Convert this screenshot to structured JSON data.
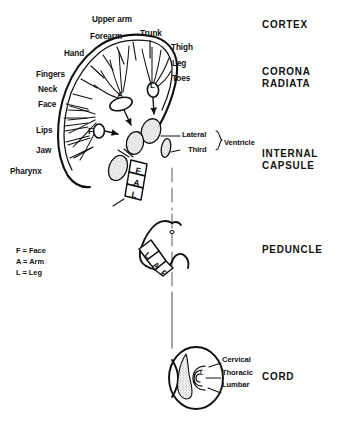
{
  "figure": {
    "ink_color": "#111111",
    "stipple_color": "#9a9a9a",
    "background": "#ffffff"
  },
  "levels": [
    {
      "id": "cortex",
      "line1": "CORTEX",
      "line2": ""
    },
    {
      "id": "corona-radiata",
      "line1": "CORONA",
      "line2": "RADIATA"
    },
    {
      "id": "internal-capsule",
      "line1": "INTERNAL",
      "line2": "CAPSULE"
    },
    {
      "id": "peduncle",
      "line1": "PEDUNCLE",
      "line2": ""
    },
    {
      "id": "cord",
      "line1": "CORD",
      "line2": ""
    }
  ],
  "cortex_labels": [
    {
      "id": "upper-arm",
      "text": "Upper arm"
    },
    {
      "id": "forearm",
      "text": "Forearm"
    },
    {
      "id": "trunk",
      "text": "Trunk"
    },
    {
      "id": "hand",
      "text": "Hand"
    },
    {
      "id": "thigh",
      "text": "Thigh"
    },
    {
      "id": "leg",
      "text": "Leg"
    },
    {
      "id": "toes",
      "text": "Toes"
    },
    {
      "id": "fingers",
      "text": "Fingers"
    },
    {
      "id": "neck",
      "text": "Neck"
    },
    {
      "id": "face",
      "text": "Face"
    },
    {
      "id": "lips",
      "text": "Lips"
    },
    {
      "id": "jaw",
      "text": "Jaw"
    },
    {
      "id": "pharynx",
      "text": "Pharynx"
    }
  ],
  "ventricle": {
    "lateral": "Lateral",
    "third": "Third",
    "group": "Ventricle"
  },
  "key": [
    {
      "id": "face",
      "text": "F = Face"
    },
    {
      "id": "arm",
      "text": "A = Arm"
    },
    {
      "id": "leg",
      "text": "L = Leg"
    }
  ],
  "cord_labels": [
    {
      "id": "cervical",
      "text": "Cervical"
    },
    {
      "id": "thoracic",
      "text": "Thoracic"
    },
    {
      "id": "lumbar",
      "text": "Lumbar"
    }
  ],
  "fiber_markers": {
    "cortex_arm": "A",
    "cortex_leg": "L",
    "cortex_face": "F",
    "capsule": [
      "F",
      "A",
      "L"
    ],
    "peduncle": [
      "L",
      "A",
      "F"
    ],
    "peduncle_marker": "o",
    "cord_marker": "L"
  }
}
